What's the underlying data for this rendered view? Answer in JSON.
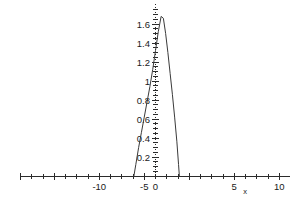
{
  "chart_data": {
    "type": "line",
    "title": "",
    "subtitle": "",
    "xlabel": "x",
    "ylabel": "",
    "grid": false,
    "legend": null,
    "xlim": [
      -12,
      12
    ],
    "ylim": [
      0,
      1.72
    ],
    "x_ticks_major": [
      -10,
      -5,
      0,
      5,
      10
    ],
    "x_tick_labels": [
      "-10",
      "-5",
      "0",
      "5",
      "10"
    ],
    "x_ticks_minor_step": 1,
    "y_ticks_major": [
      0.2,
      0.4,
      0.6,
      0.8,
      1,
      1.2,
      1.4,
      1.6
    ],
    "y_tick_labels": [
      "0.2",
      "0.4",
      "0.6",
      "0.8",
      "1",
      "1.2",
      "1.4",
      "1.6"
    ],
    "y_ticks_minor_step": 0.05,
    "series": [
      {
        "name": "curve",
        "x": [
          -1.92,
          -1.75,
          -1.5,
          -1.25,
          -1.0,
          -0.75,
          -0.5,
          -0.25,
          0.0,
          0.25,
          0.5,
          0.7,
          0.9,
          1.1,
          1.3,
          1.5,
          1.7,
          1.9,
          2.05,
          2.12
        ],
        "y": [
          0.0,
          0.12,
          0.3,
          0.46,
          0.62,
          0.78,
          0.94,
          1.12,
          1.32,
          1.52,
          1.68,
          1.66,
          1.5,
          1.3,
          1.08,
          0.86,
          0.62,
          0.36,
          0.12,
          0.0
        ]
      }
    ]
  },
  "axis": {
    "x_label_text": "x",
    "zero_label": "0"
  },
  "tick_text": {
    "x": {
      "neg10": "-10",
      "neg5": "-5",
      "zero": "0",
      "pos5": "5",
      "pos10": "10"
    },
    "y": {
      "v02": "0.2",
      "v04": "0.4",
      "v06": "0.6",
      "v08": "0.8",
      "v10": "1",
      "v12": "1.2",
      "v14": "1.4",
      "v16": "1.6"
    }
  },
  "colors": {
    "background": "#ffffff",
    "axis": "#2b2b2b",
    "curve": "#3a3a3a",
    "text": "#1a1a1a"
  }
}
